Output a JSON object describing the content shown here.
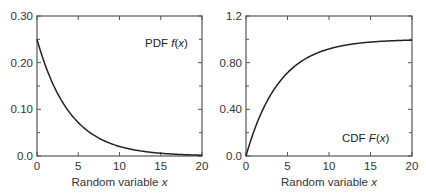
{
  "chart_data": [
    {
      "type": "line",
      "title": "",
      "annotation": {
        "prefix": "PDF ",
        "func": "f",
        "arg": "x"
      },
      "xlabel": "Random variable x",
      "xlabel_parts": {
        "text": "Random variable ",
        "var": "x"
      },
      "ylabel": "",
      "xlim": [
        0,
        20
      ],
      "ylim": [
        0,
        0.3
      ],
      "x_ticks": [
        0,
        5,
        10,
        15,
        20
      ],
      "x_tick_labels": [
        "0",
        "5",
        "10",
        "15",
        "20"
      ],
      "y_ticks": [
        0,
        0.1,
        0.2,
        0.3
      ],
      "y_tick_labels": [
        "0.0",
        "0.10",
        "0.20",
        "0.30"
      ],
      "y_minor_ticks": [
        0.05,
        0.15,
        0.25
      ],
      "grid": false,
      "series": [
        {
          "name": "PDF f(x)",
          "formula": "0.25*exp(-0.25*x)",
          "x": [
            0,
            1,
            2,
            3,
            4,
            5,
            6,
            7,
            8,
            9,
            10,
            11,
            12,
            13,
            14,
            15,
            16,
            17,
            18,
            19,
            20
          ],
          "values": [
            0.25,
            0.195,
            0.152,
            0.118,
            0.092,
            0.072,
            0.056,
            0.043,
            0.034,
            0.026,
            0.021,
            0.016,
            0.012,
            0.01,
            0.008,
            0.006,
            0.005,
            0.004,
            0.003,
            0.002,
            0.002
          ]
        }
      ]
    },
    {
      "type": "line",
      "title": "",
      "annotation": {
        "prefix": "CDF ",
        "func": "F",
        "arg": "x"
      },
      "xlabel": "Random variable x",
      "xlabel_parts": {
        "text": "Random variable ",
        "var": "x"
      },
      "ylabel": "",
      "xlim": [
        0,
        20
      ],
      "ylim": [
        0,
        1.2
      ],
      "x_ticks": [
        0,
        5,
        10,
        15,
        20
      ],
      "x_tick_labels": [
        "0",
        "5",
        "10",
        "15",
        "20"
      ],
      "y_ticks": [
        0,
        0.4,
        0.8,
        1.2
      ],
      "y_tick_labels": [
        "0.0",
        "0.40",
        "0.80",
        "1.2"
      ],
      "y_minor_ticks": [
        0.2,
        0.6,
        1.0
      ],
      "grid": false,
      "series": [
        {
          "name": "CDF F(x)",
          "formula": "1-exp(-0.25*x)",
          "x": [
            0,
            1,
            2,
            3,
            4,
            5,
            6,
            7,
            8,
            9,
            10,
            11,
            12,
            13,
            14,
            15,
            16,
            17,
            18,
            19,
            20
          ],
          "values": [
            0.0,
            0.221,
            0.393,
            0.528,
            0.632,
            0.713,
            0.777,
            0.826,
            0.865,
            0.895,
            0.918,
            0.936,
            0.95,
            0.961,
            0.97,
            0.977,
            0.982,
            0.986,
            0.989,
            0.991,
            0.993
          ]
        }
      ]
    }
  ]
}
